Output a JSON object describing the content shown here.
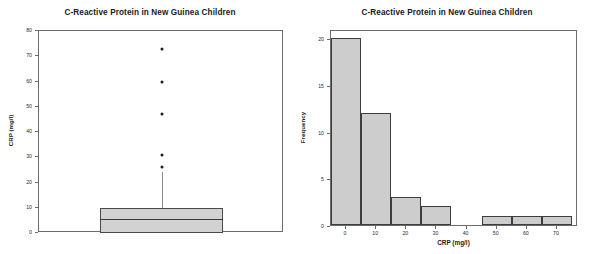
{
  "figure": {
    "panels": [
      "boxplot",
      "histogram"
    ]
  },
  "boxplot": {
    "title": "C-Reactive Protein in New Guinea Children",
    "y_axis_label": "CRP (mg/l)",
    "y_ticks": [
      "0",
      "10",
      "20",
      "30",
      "40",
      "50",
      "60",
      "70",
      "80"
    ],
    "x_axis_label": ""
  },
  "histogram": {
    "title": "C-Reactive Protein in New Guinea Children",
    "y_axis_label": "Frequency",
    "x_axis_label": "CRP (mg/l)",
    "y_ticks": [
      "0",
      "5",
      "10",
      "15",
      "20"
    ],
    "x_ticks": [
      "0",
      "10",
      "20",
      "30",
      "40",
      "50",
      "60",
      "70"
    ]
  },
  "chart_data": [
    {
      "type": "box",
      "title": "C-Reactive Protein in New Guinea Children",
      "xlabel": "",
      "ylabel": "CRP (mg/l)",
      "ylim": [
        0,
        80
      ],
      "ytick_values": [
        0,
        10,
        20,
        30,
        40,
        50,
        60,
        70,
        80
      ],
      "grid": false,
      "legend": "none",
      "boxes": [
        {
          "name": "CRP",
          "q1": 0,
          "median": 5.5,
          "q3": 10,
          "whisker_low": 0,
          "whisker_high": 24,
          "outliers": [
            26,
            31,
            47,
            60,
            73
          ],
          "fill_color": "#d2d2d2",
          "line_color": "#4a4a4a"
        }
      ]
    },
    {
      "type": "bar",
      "subtype": "histogram",
      "title": "C-Reactive Protein in New Guinea Children",
      "xlabel": "CRP (mg/l)",
      "ylabel": "Frequency",
      "xlim": [
        -5,
        77
      ],
      "ylim": [
        0,
        21
      ],
      "xtick_values": [
        0,
        10,
        20,
        30,
        40,
        50,
        60,
        70
      ],
      "ytick_values": [
        0,
        5,
        10,
        15,
        20
      ],
      "grid": false,
      "legend": "none",
      "bin_width": 10,
      "bin_centers": [
        0,
        10,
        20,
        30,
        40,
        50,
        60,
        70
      ],
      "categories": [
        "0",
        "10",
        "20",
        "30",
        "40",
        "50",
        "60",
        "70"
      ],
      "values": [
        20,
        12,
        3,
        2,
        0,
        1,
        1,
        1
      ],
      "bar_fill_color": "#cdcdcd",
      "bar_line_color": "#3d3d3d"
    }
  ]
}
